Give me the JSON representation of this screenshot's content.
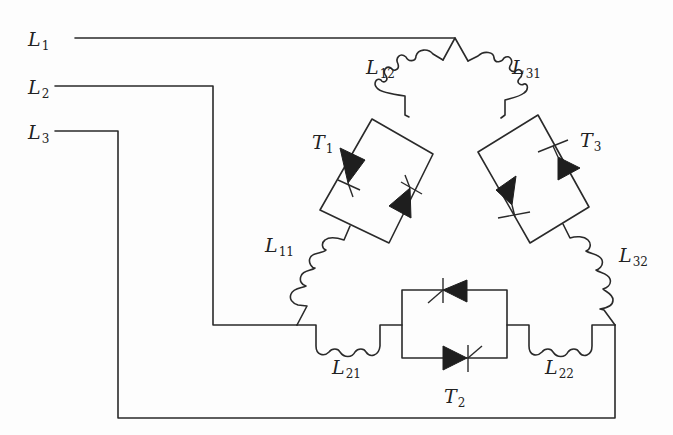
{
  "diagram": {
    "type": "circuit-schematic",
    "stroke_color": "#2a2a2a",
    "fill_color": "#1e1e1e",
    "lines": [
      {
        "id": "L1",
        "base": "L",
        "sub": "1",
        "x": 28,
        "y": 30
      },
      {
        "id": "L2",
        "base": "L",
        "sub": "2",
        "x": 28,
        "y": 78
      },
      {
        "id": "L3",
        "base": "L",
        "sub": "3",
        "x": 28,
        "y": 123
      }
    ],
    "inductors": [
      {
        "id": "L12",
        "base": "L",
        "sub": "12",
        "x": 366,
        "y": 58
      },
      {
        "id": "L31",
        "base": "L",
        "sub": "31",
        "x": 512,
        "y": 58
      },
      {
        "id": "L11",
        "base": "L",
        "sub": "11",
        "x": 265,
        "y": 236
      },
      {
        "id": "L32",
        "base": "L",
        "sub": "32",
        "x": 619,
        "y": 246
      },
      {
        "id": "L21",
        "base": "L",
        "sub": "21",
        "x": 332,
        "y": 358
      },
      {
        "id": "L22",
        "base": "L",
        "sub": "22",
        "x": 545,
        "y": 358
      }
    ],
    "thyristor_pairs": [
      {
        "id": "T1",
        "base": "T",
        "sub": "1",
        "x": 312,
        "y": 133
      },
      {
        "id": "T2",
        "base": "T",
        "sub": "2",
        "x": 444,
        "y": 387
      },
      {
        "id": "T3",
        "base": "T",
        "sub": "3",
        "x": 580,
        "y": 131
      }
    ]
  }
}
